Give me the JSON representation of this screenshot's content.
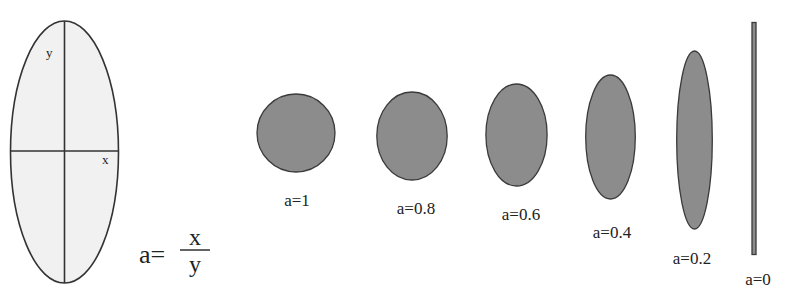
{
  "diagram": {
    "reference_ellipse": {
      "axis_labels": {
        "x": "x",
        "y": "y"
      },
      "fill": "#f1f1f1",
      "stroke": "#333333"
    },
    "formula": {
      "lhs": "a=",
      "numerator": "x",
      "denominator": "y"
    },
    "shape_fill": "#8c8c8c",
    "shape_stroke": "#3a3a3a",
    "shapes": [
      {
        "a": 1,
        "label": "a=1"
      },
      {
        "a": 0.8,
        "label": "a=0.8"
      },
      {
        "a": 0.6,
        "label": "a=0.6"
      },
      {
        "a": 0.4,
        "label": "a=0.4"
      },
      {
        "a": 0.2,
        "label": "a=0.2"
      },
      {
        "a": 0,
        "label": "a=0"
      }
    ]
  }
}
